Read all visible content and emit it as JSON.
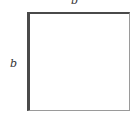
{
  "diagram": {
    "shape": "square",
    "labels": {
      "top_side": "b",
      "left_side": "b"
    },
    "colors": {
      "highlighted_edges": "#4a4a4a",
      "other_edges": "#9a9a9a",
      "fill": "#ffffff"
    }
  }
}
